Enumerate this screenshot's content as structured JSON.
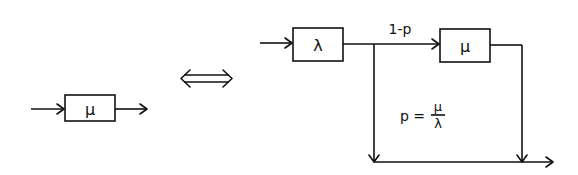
{
  "diagram": {
    "left": {
      "server": {
        "label": "μ"
      }
    },
    "equivalence_symbol": "⇔",
    "right": {
      "first_server": {
        "label": "λ"
      },
      "second_server": {
        "label": "μ"
      },
      "branch_continue_label": "1-p",
      "branch_bypass_label": {
        "prefix": "p =",
        "numerator": "μ",
        "denominator": "λ"
      }
    },
    "colors": {
      "ink": "#111111",
      "background": "#ffffff"
    }
  }
}
